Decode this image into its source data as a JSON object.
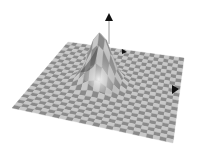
{
  "scene": {
    "description": "3D rendered Gaussian bump surface with checkerboard texture and coordinate axis arrows",
    "colors": {
      "background": "#ffffff",
      "checker_light": "#c8c8c8",
      "checker_dark": "#8a8a8a",
      "highlight": "#f2f2f2",
      "shadow": "#3a3a3a",
      "arrow": "#111111",
      "axis_line": "#9a9a9a"
    },
    "grid_cells": 24,
    "axes": [
      {
        "name": "z",
        "direction": "up"
      },
      {
        "name": "x",
        "direction": "right"
      },
      {
        "name": "y",
        "direction": "back"
      }
    ]
  }
}
